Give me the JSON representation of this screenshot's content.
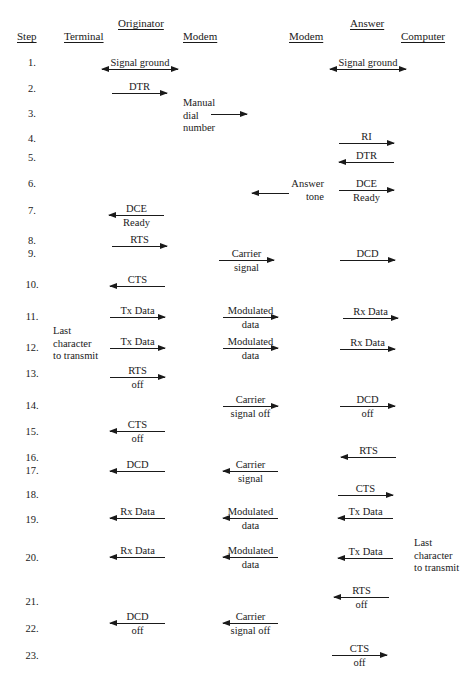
{
  "headers": {
    "originator": {
      "label": "Originator",
      "x": 118,
      "y": 17
    },
    "answer": {
      "label": "Answer",
      "x": 350,
      "y": 17
    },
    "step": {
      "label": "Step",
      "x": 17,
      "y": 30
    },
    "terminal": {
      "label": "Terminal",
      "x": 64,
      "y": 30
    },
    "originator_modem": {
      "label": "Modem",
      "x": 183,
      "y": 30
    },
    "answer_modem": {
      "label": "Modem",
      "x": 289,
      "y": 30
    },
    "computer": {
      "label": "Computer",
      "x": 401,
      "y": 30
    }
  },
  "steps": [
    {
      "label": "1.",
      "y": 57
    },
    {
      "label": "2.",
      "y": 83
    },
    {
      "label": "3.",
      "y": 108
    },
    {
      "label": "4.",
      "y": 133
    },
    {
      "label": "5.",
      "y": 152
    },
    {
      "label": "6.",
      "y": 178
    },
    {
      "label": "7.",
      "y": 205
    },
    {
      "label": "8.",
      "y": 235
    },
    {
      "label": "9.",
      "y": 248
    },
    {
      "label": "10.",
      "y": 279
    },
    {
      "label": "11.",
      "y": 311
    },
    {
      "label": "12.",
      "y": 342
    },
    {
      "label": "13.",
      "y": 368
    },
    {
      "label": "14.",
      "y": 400
    },
    {
      "label": "15.",
      "y": 426
    },
    {
      "label": "16.",
      "y": 452
    },
    {
      "label": "17.",
      "y": 465
    },
    {
      "label": "18.",
      "y": 489
    },
    {
      "label": "19.",
      "y": 514
    },
    {
      "label": "20.",
      "y": 552
    },
    {
      "label": "21.",
      "y": 596
    },
    {
      "label": "22.",
      "y": 623
    },
    {
      "label": "23.",
      "y": 650
    }
  ],
  "notes": [
    {
      "id": "manual-dial-number",
      "lines": [
        "Manual",
        "dial",
        "number"
      ],
      "x": 183,
      "y": 97
    },
    {
      "id": "answer-tone",
      "lines": [
        "Answer",
        "tone"
      ],
      "x": 290,
      "y": 178,
      "align": "right",
      "width": 34
    },
    {
      "id": "last-character-originator",
      "lines": [
        "Last",
        "character",
        "to transmit"
      ],
      "x": 53,
      "y": 325
    },
    {
      "id": "last-character-answer",
      "lines": [
        "Last",
        "character",
        "to transmit"
      ],
      "x": 414,
      "y": 537
    }
  ],
  "arrows": [
    {
      "id": "signal-ground-originator",
      "x1": 102,
      "x2": 178,
      "y": 69,
      "dir": "both",
      "label": [
        "Signal ground"
      ]
    },
    {
      "id": "signal-ground-answer",
      "x1": 330,
      "x2": 406,
      "y": 69,
      "dir": "both",
      "label": [
        "Signal ground"
      ]
    },
    {
      "id": "dtr-originator",
      "x1": 112,
      "x2": 167,
      "y": 93,
      "dir": "right",
      "label": [
        "DTR"
      ]
    },
    {
      "id": "dial-number",
      "x1": 211,
      "x2": 247,
      "y": 114,
      "dir": "right",
      "label": []
    },
    {
      "id": "ri",
      "x1": 339,
      "x2": 394,
      "y": 143,
      "dir": "right",
      "label": [
        "RI"
      ]
    },
    {
      "id": "dtr-answer",
      "x1": 339,
      "x2": 394,
      "y": 162,
      "dir": "left",
      "label": [
        "DTR"
      ]
    },
    {
      "id": "answer-tone",
      "x1": 252,
      "x2": 289,
      "y": 193,
      "dir": "left",
      "label": []
    },
    {
      "id": "dce-ready-answer",
      "x1": 339,
      "x2": 394,
      "y": 190,
      "dir": "right",
      "label": [
        "DCE",
        "Ready"
      ]
    },
    {
      "id": "dce-ready-originator",
      "x1": 109,
      "x2": 164,
      "y": 215,
      "dir": "left",
      "label": [
        "DCE",
        "Ready"
      ]
    },
    {
      "id": "rts",
      "x1": 112,
      "x2": 167,
      "y": 246,
      "dir": "right",
      "label": [
        "RTS"
      ]
    },
    {
      "id": "carrier-signal",
      "x1": 219,
      "x2": 274,
      "y": 260,
      "dir": "right",
      "label": [
        "Carrier",
        "signal"
      ]
    },
    {
      "id": "dcd-answer",
      "x1": 340,
      "x2": 395,
      "y": 260,
      "dir": "right",
      "label": [
        "DCD"
      ]
    },
    {
      "id": "cts",
      "x1": 110,
      "x2": 165,
      "y": 286,
      "dir": "left",
      "label": [
        "CTS"
      ]
    },
    {
      "id": "tx-data-1",
      "x1": 110,
      "x2": 165,
      "y": 317,
      "dir": "right",
      "label": [
        "Tx Data"
      ]
    },
    {
      "id": "modulated-data-1",
      "x1": 223,
      "x2": 278,
      "y": 317,
      "dir": "right",
      "label": [
        "Modulated",
        "data"
      ]
    },
    {
      "id": "rx-data-1",
      "x1": 343,
      "x2": 398,
      "y": 318,
      "dir": "right",
      "label": [
        "Rx Data"
      ]
    },
    {
      "id": "tx-data-2",
      "x1": 110,
      "x2": 165,
      "y": 348,
      "dir": "right",
      "label": [
        "Tx Data"
      ]
    },
    {
      "id": "modulated-data-2",
      "x1": 223,
      "x2": 278,
      "y": 348,
      "dir": "right",
      "label": [
        "Modulated",
        "data"
      ]
    },
    {
      "id": "rx-data-2",
      "x1": 340,
      "x2": 395,
      "y": 349,
      "dir": "right",
      "label": [
        "Rx Data"
      ]
    },
    {
      "id": "rts-off",
      "x1": 110,
      "x2": 165,
      "y": 377,
      "dir": "right",
      "label": [
        "RTS",
        "off"
      ]
    },
    {
      "id": "carrier-signal-off",
      "x1": 223,
      "x2": 278,
      "y": 406,
      "dir": "right",
      "label": [
        "Carrier",
        "signal off"
      ]
    },
    {
      "id": "dcd-off-answer",
      "x1": 340,
      "x2": 395,
      "y": 406,
      "dir": "right",
      "label": [
        "DCD",
        "off"
      ]
    },
    {
      "id": "cts-off",
      "x1": 110,
      "x2": 165,
      "y": 431,
      "dir": "left",
      "label": [
        "CTS",
        "off"
      ]
    },
    {
      "id": "rts-answer",
      "x1": 341,
      "x2": 396,
      "y": 457,
      "dir": "left",
      "label": [
        "RTS"
      ]
    },
    {
      "id": "dcd-originator",
      "x1": 110,
      "x2": 165,
      "y": 471,
      "dir": "left",
      "label": [
        "DCD"
      ]
    },
    {
      "id": "carrier-signal-back",
      "x1": 223,
      "x2": 278,
      "y": 471,
      "dir": "left",
      "label": [
        "Carrier",
        "signal"
      ]
    },
    {
      "id": "cts-answer",
      "x1": 338,
      "x2": 393,
      "y": 495,
      "dir": "right",
      "label": [
        "CTS"
      ]
    },
    {
      "id": "rx-data-3",
      "x1": 110,
      "x2": 165,
      "y": 518,
      "dir": "left",
      "label": [
        "Rx Data"
      ]
    },
    {
      "id": "modulated-data-3",
      "x1": 223,
      "x2": 278,
      "y": 518,
      "dir": "left",
      "label": [
        "Modulated",
        "data"
      ]
    },
    {
      "id": "tx-data-3",
      "x1": 338,
      "x2": 393,
      "y": 518,
      "dir": "left",
      "label": [
        "Tx Data"
      ]
    },
    {
      "id": "rx-data-4",
      "x1": 110,
      "x2": 165,
      "y": 557,
      "dir": "left",
      "label": [
        "Rx Data"
      ]
    },
    {
      "id": "modulated-data-4",
      "x1": 223,
      "x2": 278,
      "y": 557,
      "dir": "left",
      "label": [
        "Modulated",
        "data"
      ]
    },
    {
      "id": "tx-data-4",
      "x1": 338,
      "x2": 393,
      "y": 558,
      "dir": "left",
      "label": [
        "Tx Data"
      ]
    },
    {
      "id": "rts-off-answer",
      "x1": 334,
      "x2": 389,
      "y": 597,
      "dir": "left",
      "label": [
        "RTS",
        "off"
      ]
    },
    {
      "id": "dcd-off-originator",
      "x1": 110,
      "x2": 165,
      "y": 623,
      "dir": "left",
      "label": [
        "DCD",
        "off"
      ]
    },
    {
      "id": "carrier-signal-off-back",
      "x1": 223,
      "x2": 278,
      "y": 623,
      "dir": "left",
      "label": [
        "Carrier",
        "signal off"
      ]
    },
    {
      "id": "cts-off-answer",
      "x1": 332,
      "x2": 387,
      "y": 655,
      "dir": "right",
      "label": [
        "CTS",
        "off"
      ]
    }
  ]
}
